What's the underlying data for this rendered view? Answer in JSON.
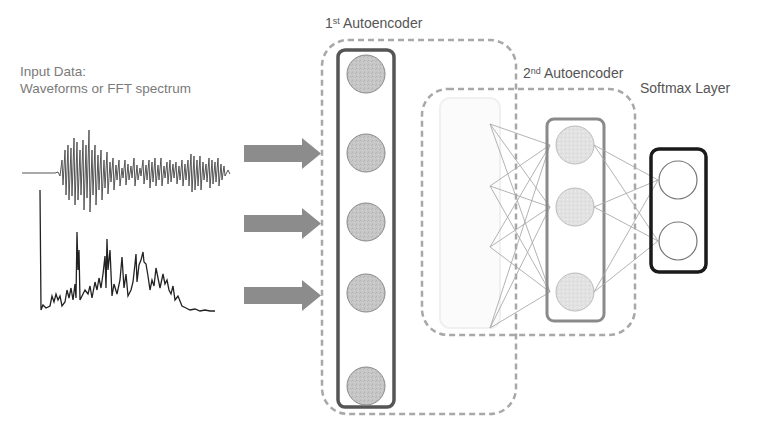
{
  "labels": {
    "input_title": "Input Data:",
    "input_subtitle": "Waveforms or FFT spectrum",
    "ae1_prefix": "1",
    "ae1_sup": "st",
    "ae1_name": "Autoencoder",
    "ae2_prefix": "2",
    "ae2_sup": "nd",
    "ae2_name": "Autoencoder",
    "softmax": "Softmax Layer"
  },
  "layers": {
    "input_layer_nodes": 5,
    "hidden_layer_nodes": 3,
    "softmax_nodes": 2
  },
  "inputs": {
    "signals": [
      "waveform",
      "fft-spectrum"
    ],
    "arrows": 3
  },
  "colors": {
    "node_fill": "#c8c8c8",
    "hidden_node_fill": "#e4e4e4",
    "box_border": "#555555",
    "hidden_box_border": "#8a8a8a",
    "softmax_border": "#1a1a1a",
    "dashed": "#a0a0a0",
    "arrow": "#8c8c8c",
    "signal": "#444444"
  }
}
